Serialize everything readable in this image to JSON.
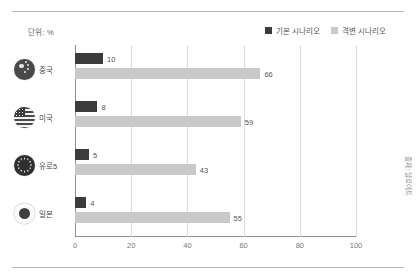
{
  "unit_label": "단위: %",
  "source_note": "출처: 딜로이트",
  "legend": {
    "position": "top-right",
    "items": [
      {
        "label": "기본 시나리오",
        "color": "#3c3c3c",
        "swatch_name": "legend-swatch-baseline"
      },
      {
        "label": "격변 시나리오",
        "color": "#c9c9c9",
        "swatch_name": "legend-swatch-upheaval"
      }
    ]
  },
  "chart_data": {
    "type": "bar",
    "orientation": "horizontal",
    "title": "",
    "xlabel": "",
    "ylabel": "",
    "categories": [
      "중국",
      "미국",
      "유로5",
      "일본"
    ],
    "category_icons": [
      "china-flag-icon",
      "usa-flag-icon",
      "eu-flag-icon",
      "japan-flag-icon"
    ],
    "series": [
      {
        "name": "기본 시나리오",
        "color": "#3c3c3c",
        "values": [
          10,
          8,
          5,
          4
        ]
      },
      {
        "name": "격변 시나리오",
        "color": "#c9c9c9",
        "values": [
          66,
          59,
          43,
          55
        ]
      }
    ],
    "xlim": [
      0,
      100
    ],
    "xticks": [
      0,
      20,
      40,
      60,
      80,
      100
    ],
    "xtick_labels": [
      "0",
      "20",
      "40",
      "60",
      "80",
      "100"
    ],
    "grid": "vertical",
    "legend_position": "top-right"
  }
}
